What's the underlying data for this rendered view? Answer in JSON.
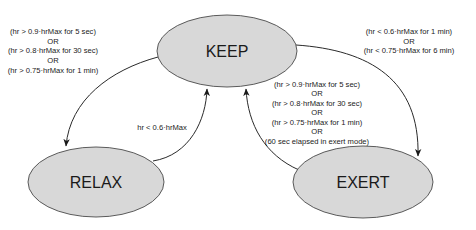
{
  "diagram": {
    "type": "state-machine",
    "colors": {
      "state_fill": "#d8d8d8",
      "state_stroke": "#4a4a4a",
      "edge": "#2a2a2a",
      "text": "#1a1a1a"
    },
    "states": {
      "keep": {
        "label": "KEEP"
      },
      "relax": {
        "label": "RELAX"
      },
      "exert": {
        "label": "EXERT"
      }
    },
    "transitions": {
      "keep_to_relax": {
        "from": "KEEP",
        "to": "RELAX",
        "lines": [
          "(hr > 0.9·hrMax for 5 sec)",
          "OR",
          "(hr > 0.8·hrMax for 30 sec)",
          "OR",
          "(hr > 0.75·hrMax for 1 min)"
        ]
      },
      "relax_to_keep": {
        "from": "RELAX",
        "to": "KEEP",
        "lines": [
          "hr < 0.6·hrMax"
        ]
      },
      "exert_to_keep": {
        "from": "EXERT",
        "to": "KEEP",
        "lines": [
          "(hr > 0.9·hrMax for 5 sec)",
          "OR",
          "(hr > 0.8·hrMax for 30 sec)",
          "OR",
          "(hr > 0.75·hrMax for 1 min)",
          "OR",
          "(60 sec elapsed in exert mode)"
        ]
      },
      "keep_to_exert": {
        "from": "KEEP",
        "to": "EXERT",
        "lines": [
          "(hr < 0.6·hrMax for 1 min)",
          "OR",
          "(hr < 0.75·hrMax for 6 min)"
        ]
      }
    }
  }
}
